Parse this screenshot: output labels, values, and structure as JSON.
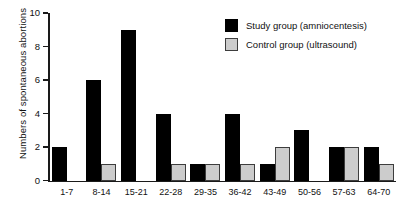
{
  "chart_data": {
    "type": "bar",
    "title": "",
    "xlabel": "",
    "ylabel": "Numbers of spontaneous abortions",
    "ylim": [
      0,
      10
    ],
    "yticks": [
      0,
      2,
      4,
      6,
      8,
      10
    ],
    "grid": false,
    "legend_position": "top-right",
    "categories": [
      "1-7",
      "8-14",
      "15-21",
      "22-28",
      "29-35",
      "36-42",
      "43-49",
      "50-56",
      "57-63",
      "64-70"
    ],
    "series": [
      {
        "name": "Study group (amniocentesis)",
        "color": "#000000",
        "values": [
          2,
          6,
          9,
          4,
          1,
          4,
          1,
          3,
          2,
          2
        ]
      },
      {
        "name": "Control group (ultrasound)",
        "color": "#cccccc",
        "values": [
          0,
          1,
          0,
          1,
          1,
          1,
          2,
          0,
          2,
          1
        ]
      }
    ]
  },
  "legend": {
    "items": [
      {
        "label": "Study group (amniocentesis)"
      },
      {
        "label": "Control group (ultrasound)"
      }
    ]
  }
}
